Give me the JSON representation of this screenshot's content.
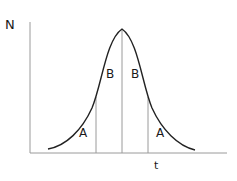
{
  "diagram": {
    "type": "normal-distribution-curve",
    "y_axis_label": "N",
    "x_axis_label": "t",
    "regions": [
      {
        "label": "A",
        "side": "left-tail"
      },
      {
        "label": "B",
        "side": "left-center"
      },
      {
        "label": "B",
        "side": "right-center"
      },
      {
        "label": "A",
        "side": "right-tail"
      }
    ],
    "colors": {
      "curve": "#222222",
      "axes": "#9a9a9a",
      "dividers": "#9a9a9a",
      "text": "#1a1a1a"
    }
  }
}
